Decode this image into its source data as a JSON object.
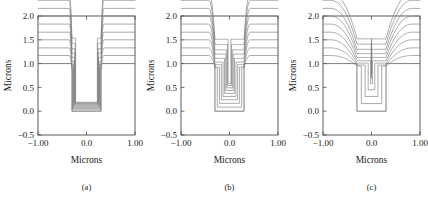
{
  "figure": {
    "panel_count": 3,
    "line_color": "#7d7d7d",
    "frame_color": "#4a4a4a",
    "background": "#ffffff"
  },
  "chart_data": [
    {
      "type": "line",
      "title": "",
      "caption": "(a)",
      "xlabel": "Microns",
      "ylabel": "Microns",
      "xlim": [
        -1.0,
        1.0
      ],
      "ylim": [
        -0.5,
        2.0
      ],
      "xticks": [
        -1.0,
        0.0,
        1.0
      ],
      "xticklabels": [
        "−1.00",
        "0.0",
        "1.00"
      ],
      "yticks": [
        -0.5,
        0.0,
        0.5,
        1.0,
        1.5,
        2.0
      ],
      "yticklabels": [
        "−0.5",
        "0.0",
        "0.5",
        "1.0",
        "1.5",
        "2.0"
      ],
      "grid": false,
      "legend": null,
      "description": "Highly directional deposition: narrow deep cusp, thin conformal layers, near-vertical sidewalls",
      "trench": {
        "x_left": -0.3,
        "x_right": 0.3,
        "y_bottom": 0.0,
        "y_top": 1.0
      },
      "cusp_half_width": 0.06,
      "series": [
        {
          "name": "contour-1",
          "thickness": 0.17,
          "floor": 0.028,
          "sidewall": 0.012,
          "cusp": 0.3
        },
        {
          "name": "contour-2",
          "thickness": 0.33,
          "floor": 0.055,
          "sidewall": 0.022,
          "cusp": 0.42
        },
        {
          "name": "contour-3",
          "thickness": 0.5,
          "floor": 0.08,
          "sidewall": 0.032,
          "cusp": 0.52
        },
        {
          "name": "contour-4",
          "thickness": 0.66,
          "floor": 0.103,
          "sidewall": 0.041,
          "cusp": 0.62
        },
        {
          "name": "contour-5",
          "thickness": 0.83,
          "floor": 0.124,
          "sidewall": 0.049,
          "cusp": 0.7
        },
        {
          "name": "contour-6",
          "thickness": 1.0,
          "floor": 0.143,
          "sidewall": 0.057,
          "cusp": 0.78
        },
        {
          "name": "contour-7",
          "thickness": 1.16,
          "floor": 0.16,
          "sidewall": 0.064,
          "cusp": 0.85
        },
        {
          "name": "contour-8",
          "thickness": 1.33,
          "floor": 0.175,
          "sidewall": 0.07,
          "cusp": 0.91
        },
        {
          "name": "contour-9",
          "thickness": 1.49,
          "floor": 0.188,
          "sidewall": 0.076,
          "cusp": 0.96
        }
      ]
    },
    {
      "type": "line",
      "title": "",
      "caption": "(b)",
      "xlabel": "Microns",
      "ylabel": "Microns",
      "xlim": [
        -1.0,
        1.0
      ],
      "ylim": [
        -0.5,
        2.0
      ],
      "xticks": [
        -1.0,
        0.0,
        1.0
      ],
      "xticklabels": [
        "−1.00",
        "0.0",
        "1.00"
      ],
      "yticks": [
        -0.5,
        0.0,
        0.5,
        1.0,
        1.5,
        2.0
      ],
      "yticklabels": [
        "−0.5",
        "0.0",
        "0.5",
        "1.0",
        "1.5",
        "2.0"
      ],
      "grid": false,
      "legend": null,
      "description": "Intermediate deposition: moderate cusp width, nested U-shaped contours filling trench from bottom",
      "trench": {
        "x_left": -0.3,
        "x_right": 0.3,
        "y_bottom": 0.0,
        "y_top": 1.0
      },
      "cusp_half_width": 0.13,
      "series": [
        {
          "name": "contour-1",
          "thickness": 0.17,
          "floor": 0.085,
          "sidewall": 0.048,
          "cusp": 0.26
        },
        {
          "name": "contour-2",
          "thickness": 0.33,
          "floor": 0.165,
          "sidewall": 0.092,
          "cusp": 0.4
        },
        {
          "name": "contour-3",
          "thickness": 0.5,
          "floor": 0.24,
          "sidewall": 0.132,
          "cusp": 0.52
        },
        {
          "name": "contour-4",
          "thickness": 0.66,
          "floor": 0.31,
          "sidewall": 0.167,
          "cusp": 0.63
        },
        {
          "name": "contour-5",
          "thickness": 0.83,
          "floor": 0.375,
          "sidewall": 0.197,
          "cusp": 0.72
        },
        {
          "name": "contour-6",
          "thickness": 1.0,
          "floor": 0.435,
          "sidewall": 0.222,
          "cusp": 0.8
        },
        {
          "name": "contour-7",
          "thickness": 1.16,
          "floor": 0.49,
          "sidewall": 0.242,
          "cusp": 0.87
        },
        {
          "name": "contour-8",
          "thickness": 1.33,
          "floor": 0.54,
          "sidewall": 0.258,
          "cusp": 0.93
        },
        {
          "name": "contour-9",
          "thickness": 1.49,
          "floor": 0.585,
          "sidewall": 0.27,
          "cusp": 0.98
        }
      ]
    },
    {
      "type": "line",
      "title": "",
      "caption": "(c)",
      "xlabel": "Microns",
      "ylabel": "Microns",
      "xlim": [
        -1.0,
        1.0
      ],
      "ylim": [
        -0.5,
        2.0
      ],
      "xticks": [
        -1.0,
        0.0,
        1.0
      ],
      "xticklabels": [
        "−1.00",
        "0.0",
        "1.00"
      ],
      "yticks": [
        -0.5,
        0.0,
        0.5,
        1.0,
        1.5,
        2.0
      ],
      "yticklabels": [
        "−0.5",
        "0.0",
        "0.5",
        "1.0",
        "1.5",
        "2.0"
      ],
      "grid": false,
      "legend": null,
      "description": "Isotropic deposition: broad smooth dish-shaped contours, wide shallow depression, fewer contours inside trench",
      "trench": {
        "x_left": -0.3,
        "x_right": 0.3,
        "y_bottom": 0.0,
        "y_top": 1.0
      },
      "cusp_half_width": 0.55,
      "series": [
        {
          "name": "contour-1",
          "thickness": 0.17,
          "floor": 0.16,
          "sidewall": 0.09,
          "cusp": 0.22
        },
        {
          "name": "contour-2",
          "thickness": 0.33,
          "floor": 0.31,
          "sidewall": 0.168,
          "cusp": 0.36
        },
        {
          "name": "contour-3",
          "thickness": 0.5,
          "floor": 0.45,
          "sidewall": 0.232,
          "cusp": 0.49
        },
        {
          "name": "contour-4",
          "thickness": 0.66,
          "floor": 0.575,
          "sidewall": 0.28,
          "cusp": 0.6
        },
        {
          "name": "contour-5",
          "thickness": 0.83,
          "floor": 0.69,
          "sidewall": 0.3,
          "cusp": 0.7
        },
        {
          "name": "contour-6",
          "thickness": 1.0,
          "floor": 0.79,
          "sidewall": 0.3,
          "cusp": 0.79
        },
        {
          "name": "contour-7",
          "thickness": 1.16,
          "floor": 0.875,
          "sidewall": 0.3,
          "cusp": 0.86
        },
        {
          "name": "contour-8",
          "thickness": 1.33,
          "floor": 0.945,
          "sidewall": 0.3,
          "cusp": 0.92
        },
        {
          "name": "contour-9",
          "thickness": 1.49,
          "floor": 1.0,
          "sidewall": 0.3,
          "cusp": 0.97
        }
      ]
    }
  ]
}
